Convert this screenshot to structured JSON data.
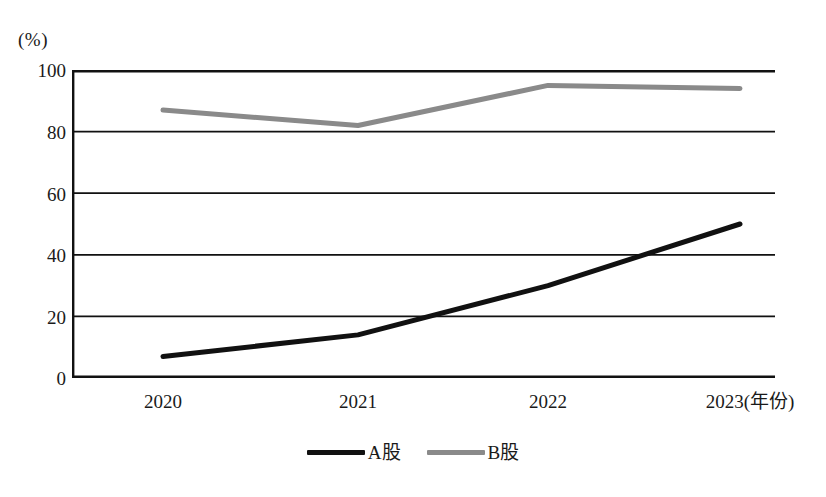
{
  "chart_data": {
    "type": "line",
    "title": "",
    "subtitle": "",
    "xlabel": "年份",
    "ylabel": "(%)",
    "y_unit_label": "(%)",
    "x_axis_suffix_label": "(年份)",
    "categories": [
      "2020",
      "2021",
      "2022",
      "2023"
    ],
    "x_tick_labels": [
      "2020",
      "2021",
      "2022",
      "2023(年份)"
    ],
    "y_ticks": [
      0,
      20,
      40,
      60,
      80,
      100
    ],
    "y_tick_labels": [
      "0",
      "20",
      "40",
      "60",
      "80",
      "100"
    ],
    "ylim": [
      0,
      100
    ],
    "grid": "horizontal",
    "legend_position": "bottom-center",
    "series": [
      {
        "name": "A股",
        "color": "#111111",
        "values": [
          7,
          14,
          30,
          50
        ]
      },
      {
        "name": "B股",
        "color": "#8a8a8a",
        "values": [
          87,
          82,
          95,
          94
        ]
      }
    ]
  },
  "legend": {
    "items": [
      {
        "label": "A股",
        "color": "#111111"
      },
      {
        "label": "B股",
        "color": "#8a8a8a"
      }
    ]
  },
  "axes": {
    "y_unit": "(%)",
    "y_tick_labels": [
      "100",
      "80",
      "60",
      "40",
      "20",
      "0"
    ],
    "x_tick_labels": [
      "2020",
      "2021",
      "2022",
      "2023(年份)"
    ]
  },
  "colors": {
    "axis": "#111111",
    "grid": "#111111",
    "series_a": "#111111",
    "series_b": "#8a8a8a",
    "background": "#ffffff"
  }
}
